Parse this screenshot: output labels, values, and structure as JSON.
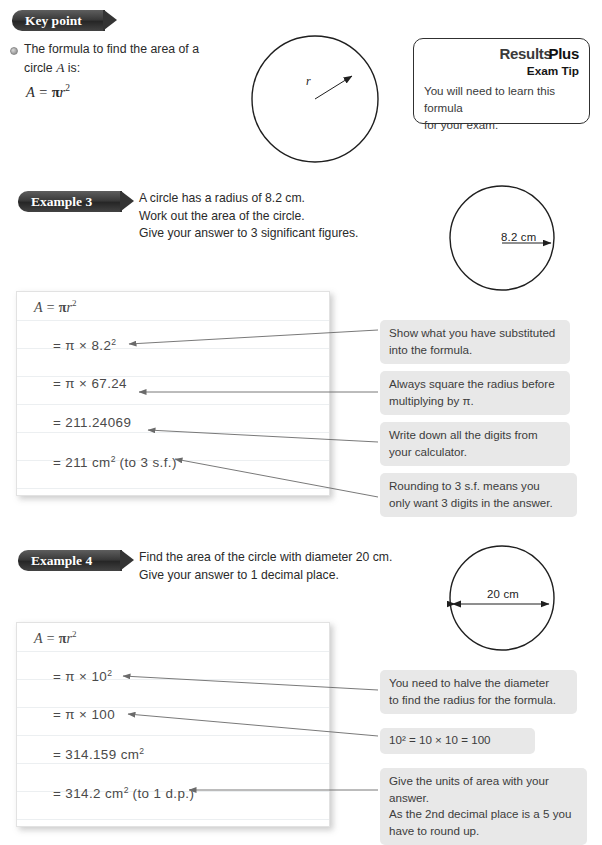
{
  "key_point": {
    "badge_label": "Key point",
    "bullet_text_line1": "The formula to find the area of a",
    "bullet_text_line2_pre": "circle ",
    "bullet_text_line2_var": "A",
    "bullet_text_line2_post": " is:",
    "formula_A": "A",
    "formula_eq": "=",
    "formula_pi": "π",
    "formula_r": "r",
    "formula_exp": "2"
  },
  "results_plus": {
    "title_part1": "Results",
    "title_part2": "Plus",
    "subtitle": "Exam Tip",
    "body_line1": "You will need to learn this formula",
    "body_line2": "for your exam."
  },
  "diagram_keypoint": {
    "radius_label": "r"
  },
  "example3": {
    "badge_label": "Example 3",
    "prompt_line1": "A circle has a radius of 8.2 cm.",
    "prompt_line2": "Work out the area of the circle.",
    "prompt_line3": "Give your answer to 3 significant figures.",
    "diagram_label": "8.2 cm",
    "solution": {
      "head_A": "A",
      "head_eq": "=",
      "head_pi": "π",
      "head_r": "r",
      "head_exp": "2",
      "line1": "= π × 8.2",
      "line1_exp": "2",
      "line2": "= π × 67.24",
      "line3": "= 211.24069",
      "line4_pre": "= 211 cm",
      "line4_exp": "2",
      "line4_post": " (to 3 s.f.)"
    },
    "notes": [
      {
        "line1": "Show what you have substituted",
        "line2": "into the formula."
      },
      {
        "line1": "Always square the radius before",
        "line2": "multiplying by π."
      },
      {
        "line1": "Write down all the digits from",
        "line2": "your calculator."
      },
      {
        "line1": "Rounding to 3 s.f. means you",
        "line2": "only want 3 digits in the answer."
      }
    ]
  },
  "example4": {
    "badge_label": "Example 4",
    "prompt_line1": "Find the area of the circle with diameter 20 cm.",
    "prompt_line2": "Give your answer to 1 decimal place.",
    "diagram_label": "20 cm",
    "solution": {
      "head_A": "A",
      "head_eq": "=",
      "head_pi": "π",
      "head_r": "r",
      "head_exp": "2",
      "line1": "= π × 10",
      "line1_exp": "2",
      "line2": "= π × 100",
      "line3_pre": "= 314.159 cm",
      "line3_exp": "2",
      "line4_pre": "= 314.2 cm",
      "line4_exp": "2",
      "line4_post": " (to 1 d.p.)"
    },
    "notes": [
      {
        "line1": "You need to halve the diameter",
        "line2": "to find the radius for the formula."
      },
      {
        "line1": "10² = 10 × 10 = 100",
        "line2": ""
      },
      {
        "line1": "Give the units of area with your answer.",
        "line2": "As the 2nd decimal place is a 5 you",
        "line3": "have to round up."
      }
    ]
  },
  "colors": {
    "badge_dark": "#343434",
    "note_bg": "#e8e8e8",
    "ink": "#2a2a2a",
    "rule": "#eceff1",
    "stroke": "#1f1f1f"
  }
}
